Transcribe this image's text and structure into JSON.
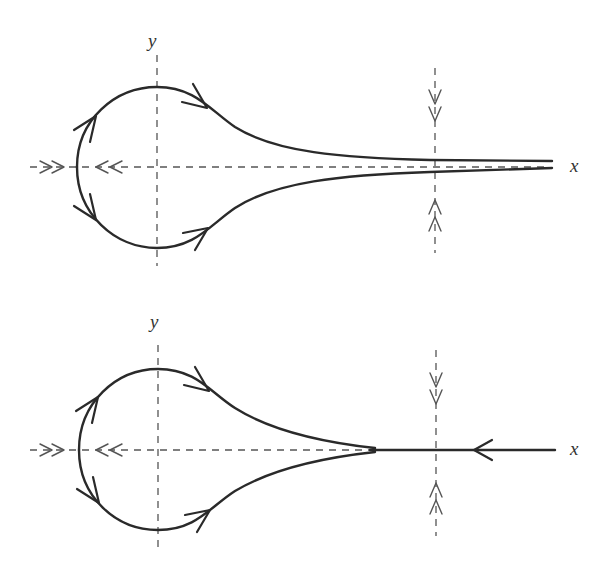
{
  "diagrams": [
    {
      "id": "top",
      "axis_labels": {
        "x": "x",
        "y": "y"
      },
      "description": "Phase portrait: loop orbit around origin with two branches asymptotically approaching the x-axis from both sides; double arrows on x-axis and vertical dashed line"
    },
    {
      "id": "bottom",
      "axis_labels": {
        "x": "x",
        "y": "y"
      },
      "description": "Phase portrait: loop orbit whose branches merge onto the x-axis; trajectory on x-axis pointing toward the origin"
    }
  ],
  "colors": {
    "curve": "#2a2a2a",
    "axis": "#555555",
    "background": "#ffffff"
  }
}
